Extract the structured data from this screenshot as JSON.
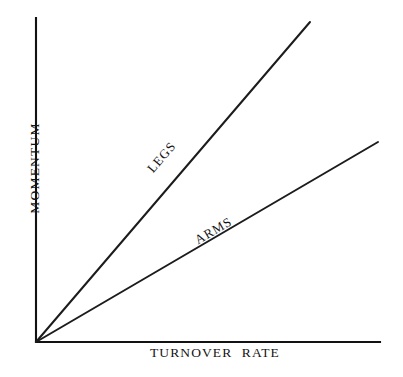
{
  "chart_data": {
    "type": "line",
    "title": "",
    "subtitle": "",
    "xlabel": "TURNOVER RATE",
    "ylabel": "MOMENTUM",
    "xticklabels": [],
    "yticklabels": [],
    "grid": false,
    "legend": "inline-along-line",
    "axis_style": "open-L-spines-no-ticks",
    "xlim": [
      0,
      1
    ],
    "ylim": [
      0,
      1
    ],
    "annotations": [
      {
        "text": "LEGS",
        "series": "LEGS",
        "placement": "below-left-of-line",
        "rotation_deg": -49.3
      },
      {
        "text": "ARMS",
        "series": "ARMS",
        "placement": "above-line",
        "rotation_deg": -30.3
      }
    ],
    "series": [
      {
        "name": "LEGS",
        "label": "LEGS",
        "color": "#1c1c1c",
        "relationship": "linear-through-origin",
        "slope_relative": 1.0,
        "x": [
          0,
          1
        ],
        "values": [
          0,
          1
        ]
      },
      {
        "name": "ARMS",
        "label": "ARMS",
        "color": "#1c1c1c",
        "relationship": "linear-through-origin",
        "slope_relative": 0.505,
        "x": [
          0,
          1
        ],
        "values": [
          0,
          0.505
        ]
      }
    ]
  },
  "geometry": {
    "origin": {
      "x": 36,
      "y": 342
    },
    "yaxis_top": {
      "x": 36,
      "y": 18
    },
    "xaxis_right": {
      "x": 380,
      "y": 342
    },
    "legs_end": {
      "x": 310,
      "y": 22
    },
    "arms_end": {
      "x": 378,
      "y": 142
    }
  },
  "colors": {
    "background": "#ffffff",
    "ink": "#141414",
    "axis": "#121212",
    "series": "#1c1c1c"
  }
}
